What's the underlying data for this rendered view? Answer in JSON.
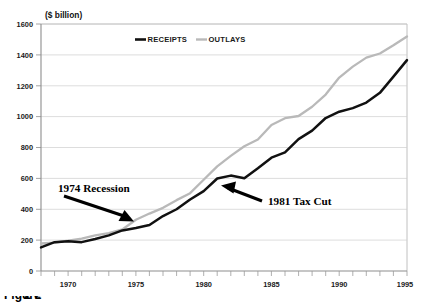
{
  "figure": {
    "caption": "Figure",
    "caption_number": "2-2",
    "unit_label": "($  billion)"
  },
  "legend": {
    "position": "top-center",
    "entries": [
      {
        "label": "RECEIPTS",
        "color": "#111111"
      },
      {
        "label": "OUTLAYS",
        "color": "#b9b9b9"
      }
    ]
  },
  "annotations": [
    {
      "label": "1974 Recession",
      "points_to_year": 1974,
      "points_to_value": 330
    },
    {
      "label": "1981 Tax Cut",
      "points_to_year": 1982,
      "points_to_value": 625
    }
  ],
  "chart_data": {
    "type": "line",
    "title": "",
    "subtitle": "",
    "xlabel": "",
    "ylabel": "($  billion)",
    "xlim": [
      1968,
      1995
    ],
    "ylim": [
      0,
      1600
    ],
    "grid": true,
    "legend_position": "top-center",
    "x": [
      1968,
      1969,
      1970,
      1971,
      1972,
      1973,
      1974,
      1975,
      1976,
      1977,
      1978,
      1979,
      1980,
      1981,
      1982,
      1983,
      1984,
      1985,
      1986,
      1987,
      1988,
      1989,
      1990,
      1991,
      1992,
      1993,
      1994,
      1995
    ],
    "xticks": [
      1970,
      1975,
      1980,
      1985,
      1990,
      1995
    ],
    "xtick_labels": [
      "1970",
      "1975",
      "1980",
      "1985",
      "1990",
      "1995"
    ],
    "yticks": [
      0,
      200,
      400,
      600,
      800,
      1000,
      1200,
      1400,
      1600
    ],
    "ytick_labels": [
      "0",
      "200",
      "400",
      "600",
      "800",
      "1000",
      "1200",
      "1400",
      "1600"
    ],
    "series": [
      {
        "name": "RECEIPTS",
        "color": "#111111",
        "values": [
          153,
          187,
          193,
          187,
          207,
          231,
          263,
          279,
          298,
          356,
          400,
          463,
          517,
          599,
          618,
          601,
          666,
          734,
          769,
          854,
          909,
          991,
          1032,
          1055,
          1091,
          1154,
          1259,
          1366
        ]
      },
      {
        "name": "OUTLAYS",
        "color": "#b9b9b9",
        "values": [
          178,
          184,
          196,
          210,
          231,
          246,
          269,
          332,
          372,
          409,
          459,
          504,
          591,
          678,
          746,
          808,
          852,
          946,
          990,
          1004,
          1064,
          1143,
          1253,
          1324,
          1382,
          1409,
          1462,
          1519
        ]
      }
    ]
  }
}
